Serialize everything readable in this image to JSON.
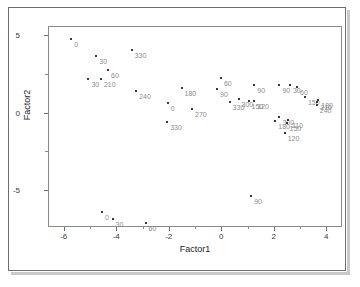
{
  "chart_data": {
    "type": "scatter",
    "title": "",
    "xlabel": "Factor1",
    "ylabel": "Factor2",
    "xlim": [
      -6.6,
      4.6
    ],
    "ylim": [
      -7.4,
      5.6
    ],
    "xticks": [
      -6,
      -4,
      -2,
      0,
      2,
      4
    ],
    "xtick_labels": [
      "-6",
      "-4",
      "-2",
      "0",
      "2",
      "4"
    ],
    "yticks": [
      5,
      0,
      -5
    ],
    "ytick_labels": [
      "5",
      "0",
      "-5"
    ],
    "yticks_minor": [
      2.5,
      -2.5
    ],
    "grid": false,
    "legend": null,
    "marker_color": "#3a3a3a",
    "label_color": "#8c8c8c",
    "axis_color": "#6e6e6e",
    "points": [
      {
        "label": "0",
        "x": -5.75,
        "y": 4.85
      },
      {
        "label": "30",
        "x": -4.8,
        "y": 3.7
      },
      {
        "label": "330",
        "x": -3.45,
        "y": 4.1
      },
      {
        "label": "60",
        "x": -4.35,
        "y": 2.85
      },
      {
        "label": "30",
        "x": -5.1,
        "y": 2.25
      },
      {
        "label": "210",
        "x": -4.62,
        "y": 2.25
      },
      {
        "label": "240",
        "x": -3.28,
        "y": 1.45
      },
      {
        "label": "0",
        "x": -2.08,
        "y": 0.7
      },
      {
        "label": "330",
        "x": -2.1,
        "y": -0.55
      },
      {
        "label": "180",
        "x": -1.55,
        "y": 1.65
      },
      {
        "label": "270",
        "x": -1.15,
        "y": 0.3
      },
      {
        "label": "60",
        "x": -0.05,
        "y": 2.3
      },
      {
        "label": "90",
        "x": -0.2,
        "y": 1.6
      },
      {
        "label": "330",
        "x": 0.28,
        "y": 0.75
      },
      {
        "label": "300",
        "x": 0.62,
        "y": 0.95
      },
      {
        "label": "150",
        "x": 1.0,
        "y": 0.8
      },
      {
        "label": "90",
        "x": 1.22,
        "y": 1.85
      },
      {
        "label": "120",
        "x": 1.22,
        "y": 0.8
      },
      {
        "label": "180",
        "x": 2.02,
        "y": -0.45
      },
      {
        "label": "300",
        "x": 2.18,
        "y": -0.25
      },
      {
        "label": "210",
        "x": 2.52,
        "y": -0.4
      },
      {
        "label": "150",
        "x": 2.45,
        "y": -0.62
      },
      {
        "label": "120",
        "x": 2.38,
        "y": -1.25
      },
      {
        "label": "90",
        "x": 2.18,
        "y": 1.85
      },
      {
        "label": "30",
        "x": 2.58,
        "y": 1.85
      },
      {
        "label": "60",
        "x": 2.85,
        "y": 1.7
      },
      {
        "label": "150",
        "x": 3.15,
        "y": 1.05
      },
      {
        "label": "240",
        "x": 3.6,
        "y": 0.55
      },
      {
        "label": "210",
        "x": 3.62,
        "y": 0.72
      },
      {
        "label": "180",
        "x": 3.66,
        "y": 0.88
      },
      {
        "label": "90",
        "x": 1.1,
        "y": -5.3
      },
      {
        "label": "0",
        "x": -4.58,
        "y": -6.35
      },
      {
        "label": "30",
        "x": -4.18,
        "y": -6.8
      },
      {
        "label": "60",
        "x": -2.92,
        "y": -7.05
      }
    ]
  }
}
